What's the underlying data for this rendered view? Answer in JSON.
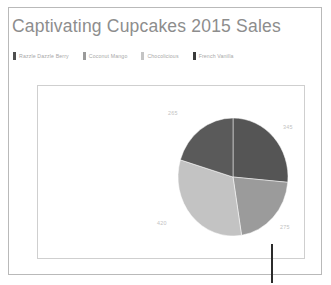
{
  "chart": {
    "title": "Captivating Cupcakes 2015 Sales",
    "marker_icon": "vertical-line-marker"
  },
  "legend": {
    "items": [
      {
        "label": "Razzle Dazzle Berry",
        "color": "#4f4f4f"
      },
      {
        "label": "Coconut Mango",
        "color": "#9a9a9a"
      },
      {
        "label": "Chocolicious",
        "color": "#c4c4c4"
      },
      {
        "label": "French Vanilla",
        "color": "#3a3a3a"
      }
    ]
  },
  "chart_data": {
    "type": "pie",
    "title": "Captivating Cupcakes 2015 Sales",
    "categories": [
      "Razzle Dazzle Berry",
      "Coconut Mango",
      "Chocolicious",
      "French Vanilla"
    ],
    "values": [
      345,
      275,
      420,
      265
    ],
    "labels": [
      "345",
      "275",
      "420",
      "265"
    ],
    "colors": [
      "#555555",
      "#9b9b9b",
      "#c3c3c3",
      "#5a5a5a"
    ],
    "legend_position": "top",
    "grid": false,
    "label_color": "#c2c2c2",
    "total": 1305
  }
}
